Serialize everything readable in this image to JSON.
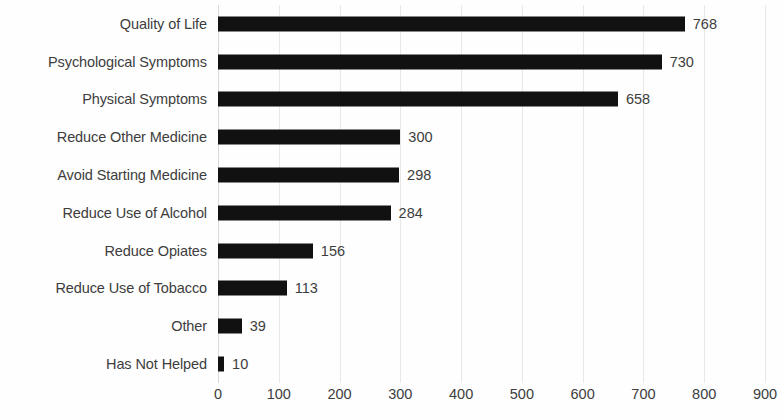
{
  "chart_data": {
    "type": "bar",
    "orientation": "horizontal",
    "title": "",
    "subtitle": "",
    "xlabel": "",
    "ylabel": "",
    "xlim": [
      0,
      900
    ],
    "xticks": [
      0,
      100,
      200,
      300,
      400,
      500,
      600,
      700,
      800,
      900
    ],
    "grid": true,
    "grid_axis": "x",
    "legend": false,
    "legend_position": "none",
    "data_labels": true,
    "bar_color": "#111111",
    "text_color": "#3d3d3d",
    "gridline_color": "#e8e8e8",
    "background_color": "#fefefe",
    "categories": [
      "Quality of Life",
      "Psychological Symptoms",
      "Physical Symptoms",
      "Reduce Other Medicine",
      "Avoid Starting Medicine",
      "Reduce Use of Alcohol",
      "Reduce Opiates",
      "Reduce Use of Tobacco",
      "Other",
      "Has Not Helped"
    ],
    "values": [
      768,
      730,
      658,
      300,
      298,
      284,
      156,
      113,
      39,
      10
    ],
    "value_labels": [
      "768",
      "730",
      "658",
      "300",
      "298",
      "284",
      "156",
      "113",
      "39",
      "10"
    ],
    "tick_labels": [
      "0",
      "100",
      "200",
      "300",
      "400",
      "500",
      "600",
      "700",
      "800",
      "900"
    ]
  }
}
